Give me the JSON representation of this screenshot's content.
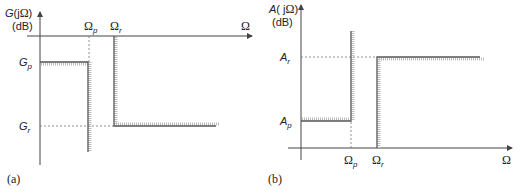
{
  "panels": [
    {
      "id": "a",
      "caption": "(a)",
      "y_axis": {
        "label_main": "G(jΩ)",
        "label_unit": "(dB)"
      },
      "x_axis": {
        "label": "Ω"
      },
      "frequency_marks": [
        {
          "symbol": "Ω",
          "sub": "p"
        },
        {
          "symbol": "Ω",
          "sub": "r"
        }
      ],
      "level_marks": [
        {
          "symbol": "G",
          "sub": "p"
        },
        {
          "symbol": "G",
          "sub": "r"
        }
      ],
      "description": "Lowpass gain specification: passband gain ≥ Gp up to Ωp, stopband gain ≤ Gr beyond Ωr"
    },
    {
      "id": "b",
      "caption": "(b)",
      "y_axis": {
        "label_main": "A(jΩ)",
        "label_unit": "(dB)"
      },
      "x_axis": {
        "label": "Ω"
      },
      "frequency_marks": [
        {
          "symbol": "Ω",
          "sub": "p"
        },
        {
          "symbol": "Ω",
          "sub": "r"
        }
      ],
      "level_marks": [
        {
          "symbol": "A",
          "sub": "r"
        },
        {
          "symbol": "A",
          "sub": "p"
        }
      ],
      "description": "Lowpass attenuation specification: passband attenuation ≤ Ap up to Ωp, stopband attenuation ≥ Ar beyond Ωr"
    }
  ]
}
